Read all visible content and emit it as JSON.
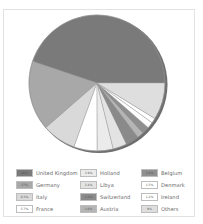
{
  "chart_data": {
    "type": "pie",
    "title": "",
    "start_angle_deg": 0,
    "direction": "counter-clockwise",
    "slices": [
      {
        "label": "United Kingdom",
        "value": 46,
        "value_label": "46%",
        "color": "#7a7a7a"
      },
      {
        "label": "Germany",
        "value": 17,
        "value_label": "17%",
        "color": "#a8a8a8"
      },
      {
        "label": "Italy",
        "value": 8.3,
        "value_label": "8.3%",
        "color": "#d9d9d9"
      },
      {
        "label": "France",
        "value": 5.7,
        "value_label": "5.7%",
        "color": "#ffffff"
      },
      {
        "label": "Holland",
        "value": 3.9,
        "value_label": "3.9%",
        "color": "#ebebeb"
      },
      {
        "label": "Libya",
        "value": 3.4,
        "value_label": "3.4%",
        "color": "#e3e3e3"
      },
      {
        "label": "Switzerland",
        "value": 3.2,
        "value_label": "3.2%",
        "color": "#8a8a8a"
      },
      {
        "label": "Austria",
        "value": 1.6,
        "value_label": "1.6%",
        "color": "#b5b5b5"
      },
      {
        "label": "Belgium",
        "value": 1.8,
        "value_label": "1.8%",
        "color": "#8f8f8f"
      },
      {
        "label": "Denmark",
        "value": 1.5,
        "value_label": "1.5%",
        "color": "#ffffff"
      },
      {
        "label": "Ireland",
        "value": 1.2,
        "value_label": "1.2%",
        "color": "#ffffff"
      },
      {
        "label": "Others",
        "value": 9,
        "value_label": "9%",
        "color": "#dedede"
      }
    ],
    "legend": {
      "placement": "bottom",
      "columns": 3,
      "order": [
        [
          "United Kingdom",
          "Germany",
          "Italy",
          "France"
        ],
        [
          "Holland",
          "Libya",
          "Switzerland",
          "Austria"
        ],
        [
          "Belgium",
          "Denmark",
          "Ireland",
          "Others"
        ]
      ]
    },
    "rim_color": "#6e6e6e",
    "slice_stroke": "#9a9a9a"
  }
}
